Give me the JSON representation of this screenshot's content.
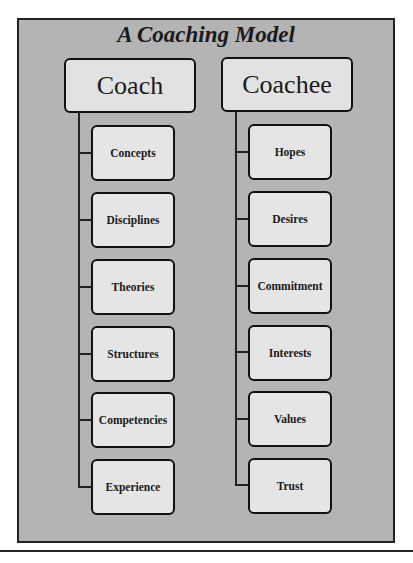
{
  "diagram": {
    "title": "A Coaching Model",
    "columns": [
      {
        "header": "Coach",
        "items": [
          "Concepts",
          "Disciplines",
          "Theories",
          "Structures",
          "Competencies",
          "Experience"
        ]
      },
      {
        "header": "Coachee",
        "items": [
          "Hopes",
          "Desires",
          "Commitment",
          "Interests",
          "Values",
          "Trust"
        ]
      }
    ]
  },
  "caption": "",
  "colors": {
    "frame_background": "#b4b4b4",
    "box_background": "#e5e5e5",
    "border": "#111111"
  }
}
